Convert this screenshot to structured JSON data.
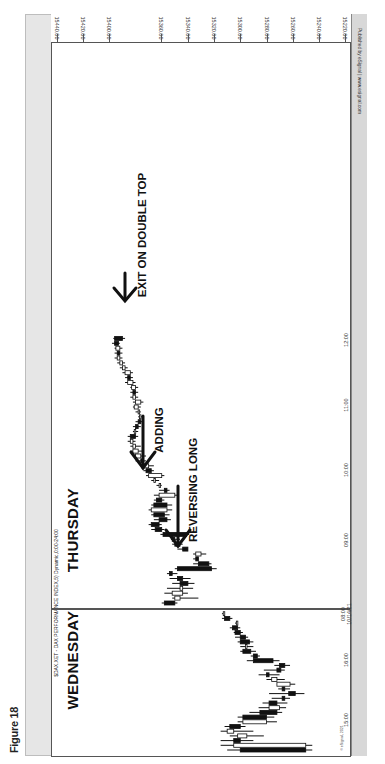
{
  "figure": {
    "label": "Figure 18"
  },
  "chart_header": {
    "title": "$DAX.XET - DAX PERFORMANCE INDEX,5) Dynamic,0:00-24:00",
    "publisher": "Published by eSignal | www.esignal.com",
    "copyright": "© eSignal, 2021"
  },
  "annotations": {
    "wednesday": "WEDNESDAY",
    "thursday": "THURSDAY",
    "reversing_long": "REVERSING LONG",
    "adding": "ADDING",
    "exit": "EXIT ON DOUBLE TOP"
  },
  "price_axis": {
    "ticks": [
      {
        "label": "15440.00",
        "x": 57
      },
      {
        "label": "15420.00",
        "x": 83
      },
      {
        "label": "15400.00",
        "x": 109
      },
      {
        "label": "15360.00",
        "x": 161
      },
      {
        "label": "15340.00",
        "x": 188
      },
      {
        "label": "15320.00",
        "x": 214
      },
      {
        "label": "15300.00",
        "x": 240
      },
      {
        "label": "15280.00",
        "x": 267
      },
      {
        "label": "15260.00",
        "x": 293
      },
      {
        "label": "15240.00",
        "x": 319
      },
      {
        "label": "15220.00",
        "x": 345
      }
    ]
  },
  "time_axis": {
    "ticks": [
      {
        "label": "15:00",
        "y": 720
      },
      {
        "label": "16:00",
        "y": 660
      },
      {
        "label": "08:00\n10/14/21",
        "y": 614
      },
      {
        "label": "09:00",
        "y": 540
      },
      {
        "label": "10:00",
        "y": 470
      },
      {
        "label": "11:00",
        "y": 405
      },
      {
        "label": "12:00",
        "y": 340
      }
    ]
  },
  "chart_data": {
    "type": "candlestick",
    "title": "$DAX.XET - DAX PERFORMANCE INDEX,5) Dynamic,0:00-24:00",
    "orientation": "rotated 90° clockwise (price axis along top, time runs bottom-to-top)",
    "xlabel": "Time (5-minute bars)",
    "ylabel": "Price",
    "ylim": [
      15215,
      15445
    ],
    "price_ticks": [
      15440,
      15420,
      15400,
      15360,
      15340,
      15320,
      15300,
      15280,
      15260,
      15240,
      15220
    ],
    "time_ticks": [
      "15:00",
      "16:00",
      "08:00 10/14/21",
      "09:00",
      "10:00",
      "11:00",
      "12:00"
    ],
    "sessions": [
      {
        "name": "WEDNESDAY",
        "bars": [
          {
            "t": "14:30",
            "o": 15300,
            "h": 15310,
            "l": 15245,
            "c": 15250
          },
          {
            "t": "14:35",
            "o": 15250,
            "h": 15315,
            "l": 15245,
            "c": 15305
          },
          {
            "t": "14:40",
            "o": 15305,
            "h": 15315,
            "l": 15290,
            "c": 15300
          },
          {
            "t": "14:45",
            "o": 15295,
            "h": 15308,
            "l": 15282,
            "c": 15302
          },
          {
            "t": "14:50",
            "o": 15305,
            "h": 15315,
            "l": 15290,
            "c": 15310
          },
          {
            "t": "14:55",
            "o": 15308,
            "h": 15312,
            "l": 15296,
            "c": 15300
          },
          {
            "t": "15:00",
            "o": 15280,
            "h": 15302,
            "l": 15272,
            "c": 15298
          },
          {
            "t": "15:05",
            "o": 15298,
            "h": 15302,
            "l": 15274,
            "c": 15280
          },
          {
            "t": "15:10",
            "o": 15285,
            "h": 15293,
            "l": 15268,
            "c": 15272
          },
          {
            "t": "15:15",
            "o": 15270,
            "h": 15286,
            "l": 15265,
            "c": 15278
          },
          {
            "t": "15:20",
            "o": 15278,
            "h": 15283,
            "l": 15264,
            "c": 15272
          },
          {
            "t": "15:25",
            "o": 15268,
            "h": 15276,
            "l": 15262,
            "c": 15266
          },
          {
            "t": "15:30",
            "o": 15263,
            "h": 15278,
            "l": 15251,
            "c": 15258
          },
          {
            "t": "15:35",
            "o": 15268,
            "h": 15271,
            "l": 15262,
            "c": 15266
          },
          {
            "t": "15:40",
            "o": 15262,
            "h": 15272,
            "l": 15258,
            "c": 15272
          },
          {
            "t": "15:45",
            "o": 15272,
            "h": 15280,
            "l": 15266,
            "c": 15276
          },
          {
            "t": "15:50",
            "o": 15280,
            "h": 15286,
            "l": 15270,
            "c": 15278
          },
          {
            "t": "15:55",
            "o": 15272,
            "h": 15282,
            "l": 15266,
            "c": 15269
          },
          {
            "t": "16:00",
            "o": 15270,
            "h": 15274,
            "l": 15262,
            "c": 15266
          },
          {
            "t": "16:05",
            "o": 15290,
            "h": 15295,
            "l": 15270,
            "c": 15275
          },
          {
            "t": "16:10",
            "o": 15290,
            "h": 15292,
            "l": 15285,
            "c": 15287
          },
          {
            "t": "16:15",
            "o": 15298,
            "h": 15300,
            "l": 15288,
            "c": 15292
          },
          {
            "t": "16:20",
            "o": 15296,
            "h": 15300,
            "l": 15290,
            "c": 15296
          },
          {
            "t": "16:25",
            "o": 15300,
            "h": 15302,
            "l": 15290,
            "c": 15293
          },
          {
            "t": "16:30",
            "o": 15300,
            "h": 15304,
            "l": 15294,
            "c": 15296
          },
          {
            "t": "16:35",
            "o": 15304,
            "h": 15305,
            "l": 15298,
            "c": 15300
          },
          {
            "t": "16:40",
            "o": 15306,
            "h": 15308,
            "l": 15300,
            "c": 15302
          },
          {
            "t": "16:45",
            "o": 15303,
            "h": 15304,
            "l": 15302,
            "c": 15303
          },
          {
            "t": "16:50",
            "o": 15312,
            "h": 15314,
            "l": 15306,
            "c": 15308
          },
          {
            "t": "16:55",
            "o": 15313,
            "h": 15314,
            "l": 15313,
            "c": 15313
          }
        ]
      },
      {
        "name": "THURSDAY",
        "bars": [
          {
            "t": "08:00",
            "o": 15358,
            "h": 15360,
            "l": 15348,
            "c": 15350
          },
          {
            "t": "08:05",
            "o": 15346,
            "h": 15352,
            "l": 15332,
            "c": 15350
          },
          {
            "t": "08:10",
            "o": 15344,
            "h": 15358,
            "l": 15340,
            "c": 15352
          },
          {
            "t": "08:15",
            "o": 15344,
            "h": 15356,
            "l": 15336,
            "c": 15346
          },
          {
            "t": "08:20",
            "o": 15346,
            "h": 15352,
            "l": 15335,
            "c": 15340
          },
          {
            "t": "08:25",
            "o": 15348,
            "h": 15354,
            "l": 15338,
            "c": 15344
          },
          {
            "t": "08:30",
            "o": 15354,
            "h": 15356,
            "l": 15348,
            "c": 15352
          },
          {
            "t": "08:35",
            "o": 15348,
            "h": 15350,
            "l": 15318,
            "c": 15322
          },
          {
            "t": "08:40",
            "o": 15332,
            "h": 15336,
            "l": 15322,
            "c": 15324
          },
          {
            "t": "08:45",
            "o": 15334,
            "h": 15336,
            "l": 15332,
            "c": 15332
          },
          {
            "t": "08:50",
            "o": 15330,
            "h": 15336,
            "l": 15326,
            "c": 15334
          },
          {
            "t": "08:55",
            "o": 15344,
            "h": 15348,
            "l": 15340,
            "c": 15340
          },
          {
            "t": "09:00",
            "o": 15350,
            "h": 15352,
            "l": 15344,
            "c": 15346
          },
          {
            "t": "09:05",
            "o": 15352,
            "h": 15353,
            "l": 15346,
            "c": 15350
          },
          {
            "t": "09:10",
            "o": 15359,
            "h": 15361,
            "l": 15339,
            "c": 15341
          },
          {
            "t": "09:15",
            "o": 15365,
            "h": 15368,
            "l": 15358,
            "c": 15360
          },
          {
            "t": "09:20",
            "o": 15368,
            "h": 15370,
            "l": 15360,
            "c": 15362
          },
          {
            "t": "09:25",
            "o": 15362,
            "h": 15366,
            "l": 15353,
            "c": 15356
          },
          {
            "t": "09:30",
            "o": 15366,
            "h": 15368,
            "l": 15354,
            "c": 15358
          },
          {
            "t": "09:35",
            "o": 15356,
            "h": 15370,
            "l": 15352,
            "c": 15368
          },
          {
            "t": "09:40",
            "o": 15366,
            "h": 15368,
            "l": 15352,
            "c": 15356
          },
          {
            "t": "09:45",
            "o": 15364,
            "h": 15366,
            "l": 15358,
            "c": 15360
          },
          {
            "t": "09:50",
            "o": 15350,
            "h": 15366,
            "l": 15348,
            "c": 15362
          },
          {
            "t": "09:55",
            "o": 15358,
            "h": 15362,
            "l": 15354,
            "c": 15356
          },
          {
            "t": "10:00",
            "o": 15362,
            "h": 15364,
            "l": 15360,
            "c": 15362
          },
          {
            "t": "10:05",
            "o": 15366,
            "h": 15368,
            "l": 15362,
            "c": 15366
          },
          {
            "t": "10:10",
            "o": 15360,
            "h": 15372,
            "l": 15358,
            "c": 15370
          },
          {
            "t": "10:15",
            "o": 15372,
            "h": 15374,
            "l": 15366,
            "c": 15368
          },
          {
            "t": "10:20",
            "o": 15370,
            "h": 15376,
            "l": 15366,
            "c": 15374
          },
          {
            "t": "10:25",
            "o": 15376,
            "h": 15380,
            "l": 15372,
            "c": 15374
          },
          {
            "t": "10:30",
            "o": 15376,
            "h": 15382,
            "l": 15372,
            "c": 15380
          },
          {
            "t": "10:35",
            "o": 15378,
            "h": 15384,
            "l": 15374,
            "c": 15382
          },
          {
            "t": "10:40",
            "o": 15380,
            "h": 15384,
            "l": 15376,
            "c": 15382
          },
          {
            "t": "10:45",
            "o": 15382,
            "h": 15386,
            "l": 15380,
            "c": 15384
          },
          {
            "t": "10:50",
            "o": 15384,
            "h": 15386,
            "l": 15378,
            "c": 15380
          },
          {
            "t": "10:55",
            "o": 15380,
            "h": 15382,
            "l": 15378,
            "c": 15381
          },
          {
            "t": "11:00",
            "o": 15380,
            "h": 15382,
            "l": 15376,
            "c": 15378
          },
          {
            "t": "11:05",
            "o": 15378,
            "h": 15380,
            "l": 15374,
            "c": 15376
          },
          {
            "t": "11:10",
            "o": 15376,
            "h": 15378,
            "l": 15374,
            "c": 15377
          },
          {
            "t": "11:15",
            "o": 15378,
            "h": 15380,
            "l": 15376,
            "c": 15378
          },
          {
            "t": "11:20",
            "o": 15378,
            "h": 15382,
            "l": 15376,
            "c": 15381
          },
          {
            "t": "11:25",
            "o": 15376,
            "h": 15382,
            "l": 15374,
            "c": 15380
          },
          {
            "t": "11:30",
            "o": 15380,
            "h": 15384,
            "l": 15378,
            "c": 15382
          },
          {
            "t": "11:35",
            "o": 15382,
            "h": 15384,
            "l": 15378,
            "c": 15380
          },
          {
            "t": "11:40",
            "o": 15380,
            "h": 15384,
            "l": 15378,
            "c": 15383
          },
          {
            "t": "11:45",
            "o": 15382,
            "h": 15388,
            "l": 15380,
            "c": 15386
          },
          {
            "t": "11:50",
            "o": 15386,
            "h": 15388,
            "l": 15382,
            "c": 15384
          },
          {
            "t": "11:55",
            "o": 15384,
            "h": 15390,
            "l": 15382,
            "c": 15388
          },
          {
            "t": "12:00",
            "o": 15388,
            "h": 15392,
            "l": 15386,
            "c": 15390
          },
          {
            "t": "12:05",
            "o": 15390,
            "h": 15394,
            "l": 15388,
            "c": 15392
          },
          {
            "t": "12:10",
            "o": 15392,
            "h": 15396,
            "l": 15390,
            "c": 15394
          },
          {
            "t": "12:15",
            "o": 15394,
            "h": 15396,
            "l": 15390,
            "c": 15392
          },
          {
            "t": "12:20",
            "o": 15392,
            "h": 15396,
            "l": 15390,
            "c": 15395
          },
          {
            "t": "12:25",
            "o": 15396,
            "h": 15398,
            "l": 15392,
            "c": 15393
          },
          {
            "t": "12:30",
            "o": 15396,
            "h": 15397,
            "l": 15388,
            "c": 15390
          }
        ]
      }
    ],
    "annotations": [
      {
        "text": "REVERSING LONG",
        "at": "08:55",
        "arrow": true
      },
      {
        "text": "ADDING",
        "at": "10:00",
        "arrow": true
      },
      {
        "text": "EXIT ON DOUBLE TOP",
        "at": "12:30",
        "arrow": true
      }
    ],
    "session_divider": "between 16:55 (Wed) and 08:00 10/14/21 (Thu)",
    "grid": false,
    "legend": "none"
  }
}
